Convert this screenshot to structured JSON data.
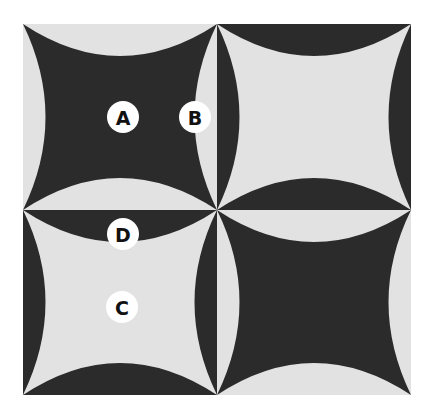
{
  "figure": {
    "colors": {
      "dark": "#2b2b2b",
      "light": "#e2e2e2",
      "label_bg": "#ffffff",
      "label_text": "#111111"
    },
    "tiles": [
      {
        "id": "top-left",
        "center": "dark",
        "segments": "light"
      },
      {
        "id": "top-right",
        "center": "light",
        "segments": "dark"
      },
      {
        "id": "bottom-left",
        "center": "light",
        "segments": "dark"
      },
      {
        "id": "bottom-right",
        "center": "dark",
        "segments": "light"
      }
    ],
    "labels": [
      {
        "text": "A",
        "x": 123,
        "y": 117
      },
      {
        "text": "B",
        "x": 195,
        "y": 117
      },
      {
        "text": "D",
        "x": 123,
        "y": 234
      },
      {
        "text": "C",
        "x": 122,
        "y": 307
      }
    ]
  }
}
